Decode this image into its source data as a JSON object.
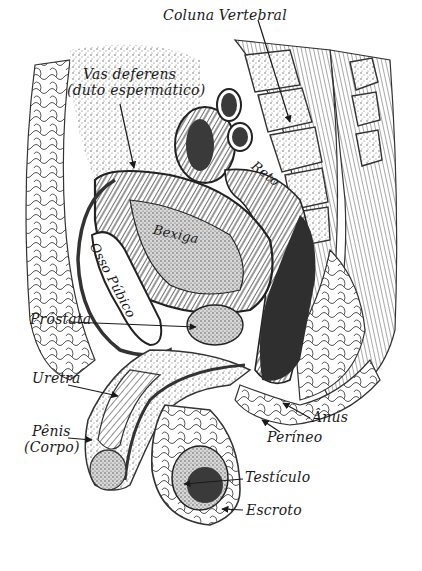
{
  "figure": {
    "language": "pt-BR",
    "style": "hand-drawn ink illustration, black on white",
    "colors": {
      "ink": "#1a1a1a",
      "dark_fill": "#3a3a3a",
      "stipple": "#7a7a7a",
      "background": "#ffffff"
    }
  },
  "labels": {
    "coluna_vertebral": "Coluna Vertebral",
    "vas_deferens_line1": "Vas deferens",
    "vas_deferens_line2": "(duto espermático)",
    "reto": "Reto",
    "bexiga": "Bexiga",
    "osso_pubico": "Osso Púbico",
    "prostata": "Próstata",
    "uretra": "Uretra",
    "penis_line1": "Pênis",
    "penis_line2": "(Corpo)",
    "anus": "Ânus",
    "perineo": "Períneo",
    "testiculo": "Testículo",
    "escroto": "Escroto"
  }
}
